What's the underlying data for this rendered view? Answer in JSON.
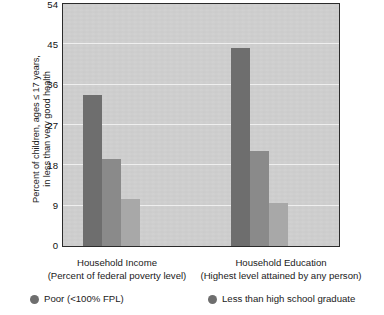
{
  "chart_data": {
    "type": "bar",
    "title": "",
    "xlabel": "",
    "ylabel": "Percent of children, ages ≤ 17 years,\nin less than very good health",
    "ylim": [
      0,
      54
    ],
    "yticks": [
      0,
      9,
      18,
      27,
      36,
      45,
      54
    ],
    "ytick_labels": [
      "0",
      "9",
      "18",
      "27",
      "36",
      "45",
      "54"
    ],
    "grid": true,
    "legend_position": "bottom",
    "categories": [
      "Household Income",
      "Household Education"
    ],
    "category_sublabels": [
      "(Percent of federal poverty level)",
      "(Highest level attained by any person)"
    ],
    "groups": [
      {
        "name": "Household Income",
        "sublabel": "(Percent of federal poverty level)",
        "bars": [
          {
            "label": "Poor (<100% FPL)",
            "value": 33.8,
            "color": "#6e6e6e"
          },
          {
            "label": "Near poor",
            "value": 19.4,
            "color": "#8a8a8a"
          },
          {
            "label": "Not poor",
            "value": 10.4,
            "color": "#a8a8a8"
          }
        ]
      },
      {
        "name": "Household Education",
        "sublabel": "(Highest level attained by any person)",
        "bars": [
          {
            "label": "Less than high school graduate",
            "value": 44.1,
            "color": "#6e6e6e"
          },
          {
            "label": "High school graduate",
            "value": 21.2,
            "color": "#8a8a8a"
          },
          {
            "label": "More than high school",
            "value": 9.7,
            "color": "#a8a8a8"
          }
        ]
      }
    ],
    "series": [
      {
        "name": "dark",
        "values": [
          33.8,
          44.1
        ],
        "color": "#6e6e6e"
      },
      {
        "name": "medium",
        "values": [
          19.4,
          21.2
        ],
        "color": "#8a8a8a"
      },
      {
        "name": "light",
        "values": [
          10.4,
          9.7
        ],
        "color": "#a8a8a8"
      }
    ],
    "colors": {
      "plot_background": "#d0d0d0",
      "axis": "#2b2b2b",
      "gridline": "#efefef",
      "bar_dark": "#6e6e6e",
      "bar_medium": "#8a8a8a",
      "bar_light": "#a8a8a8",
      "text": "#1a1a1a"
    }
  },
  "axis": {
    "y_title_line1": "Percent of children, ages ≤ 17 years,",
    "y_title_line2": "in less than very good health",
    "ticks": [
      "54",
      "45",
      "36",
      "27",
      "18",
      "9",
      "0"
    ]
  },
  "x_labels": [
    {
      "line1": "Household Income",
      "line2": "(Percent of federal poverty level)"
    },
    {
      "line1": "Household Education",
      "line2": "(Highest level attained by any person)"
    }
  ],
  "legend": {
    "items": [
      {
        "label": "Poor (<100% FPL)",
        "color": "#6e6e6e"
      },
      {
        "label": "Less than high school graduate",
        "color": "#6e6e6e"
      }
    ]
  }
}
